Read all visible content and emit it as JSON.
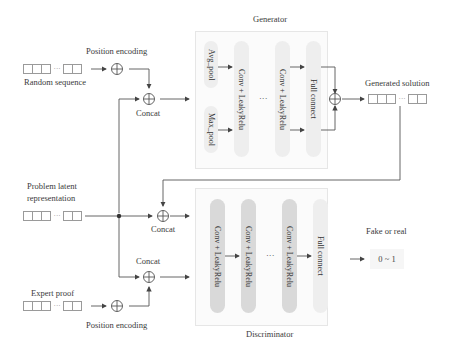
{
  "generator": {
    "title": "Generator",
    "avg_pool": "Avg_pool",
    "max_pool": "Max_pool",
    "conv1": "Conv + LeakyRelu",
    "conv2": "Conv + LeakyRelu",
    "ellipsis": "···",
    "full_connect": "Full connect"
  },
  "discriminator": {
    "title": "Discriminator",
    "conv1": "Conv + LeakyRelu",
    "conv2": "Conv + LeakyRelu",
    "conv3": "Conv + LeakyRelu",
    "ellipsis": "···",
    "full_connect": "Full connect"
  },
  "inputs": {
    "random_sequence": "Random sequence",
    "problem_latent": "Problem latent representation",
    "problem_latent_line1": "Problem latent",
    "problem_latent_line2": "representation",
    "expert_proof": "Expert proof"
  },
  "ops": {
    "position_encoding_top": "Position encoding",
    "position_encoding_bottom": "Position encoding",
    "concat_gen": "Concat",
    "concat_disc_top": "Concat",
    "concat_disc_bottom": "Concat",
    "plus_symbol": "⊕"
  },
  "outputs": {
    "generated_solution": "Generated solution",
    "fake_or_real": "Fake or real",
    "range": "0 ~ 1"
  },
  "colors": {
    "line": "#555555",
    "pill_light": "#eeeeee",
    "pill_dark": "#d9d9d9",
    "panel_border": "#e6e6e6"
  }
}
